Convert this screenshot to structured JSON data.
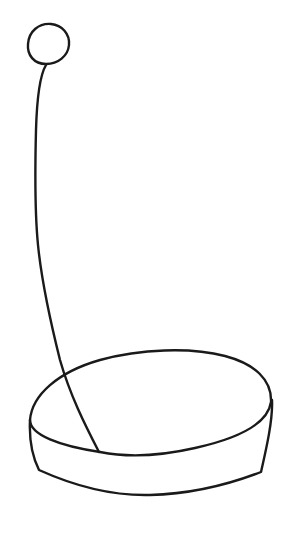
{
  "drawing": {
    "description": "Hand-drawn line sketch of a ball on a long thin stem planted in a shallow cylindrical base",
    "stroke_color": "#1a1a1a",
    "background_color": "#ffffff",
    "parts": [
      "ball",
      "stem",
      "base-top-ellipse",
      "base-side-wall"
    ]
  }
}
